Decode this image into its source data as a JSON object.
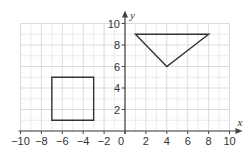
{
  "diagram": {
    "type": "coordinate-grid",
    "axes": {
      "x": {
        "label": "x",
        "min": -10,
        "max": 10,
        "tick_step": 2,
        "tick_labels": [
          "−10",
          "−8",
          "−6",
          "−4",
          "−2",
          "0",
          "2",
          "4",
          "6",
          "8",
          "10"
        ]
      },
      "y": {
        "label": "y",
        "min": 0,
        "max": 10,
        "tick_step": 2,
        "tick_labels": [
          "2",
          "4",
          "6",
          "8",
          "10"
        ]
      }
    },
    "grid": {
      "minor_step": 1,
      "major_step": 2,
      "minor_color": "#e6e6e6",
      "major_color": "#d2d2d2"
    },
    "shapes": [
      {
        "name": "square",
        "vertices": [
          [
            -7,
            1
          ],
          [
            -3,
            1
          ],
          [
            -3,
            5
          ],
          [
            -7,
            5
          ]
        ]
      },
      {
        "name": "triangle",
        "vertices": [
          [
            1,
            9
          ],
          [
            8,
            9
          ],
          [
            4,
            6
          ]
        ]
      }
    ],
    "colors": {
      "axis": "#444444",
      "shape": "#333333",
      "text": "#333333"
    }
  }
}
